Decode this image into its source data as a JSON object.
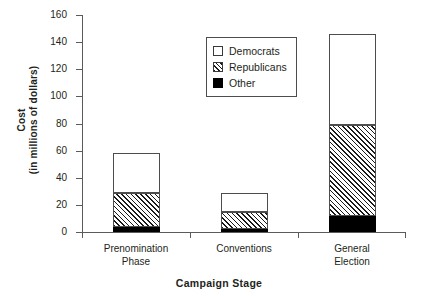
{
  "chart_data": {
    "type": "bar",
    "subtype": "stacked-bar",
    "title": "",
    "xlabel": "Campaign Stage",
    "ylabel": "Cost",
    "ylabel_line2": "(in millions of dollars)",
    "ylim": [
      0,
      160
    ],
    "ytick_values": [
      0,
      20,
      40,
      60,
      80,
      100,
      120,
      140,
      160
    ],
    "ytick_labels": [
      "0",
      "20",
      "40",
      "60",
      "80",
      "100",
      "120",
      "140",
      "160"
    ],
    "grid": false,
    "legend_position": "upper-left-inside",
    "categories": [
      "Prenomination Phase",
      "Conventions",
      "General Election"
    ],
    "category_lines": [
      [
        "Prenomination",
        "Phase"
      ],
      [
        "Conventions",
        ""
      ],
      [
        "General",
        "Election"
      ]
    ],
    "stack_order_bottom_to_top": [
      "Other",
      "Republicans",
      "Democrats"
    ],
    "series": [
      {
        "name": "Other",
        "color": "#000000",
        "pattern": "solid",
        "values": [
          4,
          2,
          12
        ]
      },
      {
        "name": "Republicans",
        "color": "#ffffff",
        "pattern": "diagonal-hatch",
        "values": [
          25,
          13,
          67
        ]
      },
      {
        "name": "Democrats",
        "color": "#ffffff",
        "pattern": "none",
        "values": [
          29,
          14,
          67
        ]
      }
    ],
    "stack_totals": [
      58,
      29,
      146
    ],
    "cumulative_tops": [
      {
        "Other": 4,
        "Republicans": 29,
        "Democrats": 58
      },
      {
        "Other": 2,
        "Republicans": 15,
        "Democrats": 29
      },
      {
        "Other": 12,
        "Republicans": 79,
        "Democrats": 146
      }
    ]
  },
  "legend": {
    "items": [
      {
        "label": "Democrats",
        "swatch": "white-square-icon"
      },
      {
        "label": "Republicans",
        "swatch": "hatched-square-icon"
      },
      {
        "label": "Other",
        "swatch": "black-square-icon"
      }
    ]
  },
  "axes": {
    "y_title_line1": "Cost",
    "y_title_line2": "(in millions of dollars)",
    "x_title": "Campaign Stage"
  },
  "colors": {
    "axis": "#5b5b5b",
    "text": "#231f20",
    "bar_outline": "#4d4d4d",
    "black_series": "#000000",
    "white_series": "#ffffff"
  }
}
